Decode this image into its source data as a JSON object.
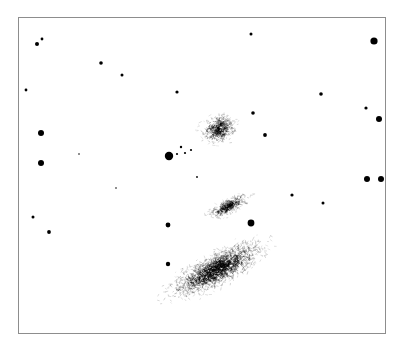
{
  "figure": {
    "kind": "astronomical-plate",
    "background_color": "#ffffff",
    "ink_color": "#000000",
    "frame": {
      "border_color": "#8d8d8d",
      "x": 18,
      "y": 17,
      "width": 368,
      "height": 317
    }
  },
  "chart_data": {
    "type": "scatter",
    "title": "",
    "xlabel": "",
    "ylabel": "",
    "xlim": [
      0,
      368
    ],
    "ylim": [
      0,
      317
    ],
    "grid": false,
    "legend": "none",
    "axes_visible": false,
    "series": [
      {
        "name": "point-sources",
        "marker": "filled-circle",
        "color": "#000000",
        "points": [
          {
            "x": 18,
            "y": 26,
            "r": 2.0
          },
          {
            "x": 23,
            "y": 21,
            "r": 1.4
          },
          {
            "x": 7,
            "y": 72,
            "r": 1.4
          },
          {
            "x": 82,
            "y": 45,
            "r": 1.8
          },
          {
            "x": 103,
            "y": 57,
            "r": 1.5
          },
          {
            "x": 158,
            "y": 74,
            "r": 1.6
          },
          {
            "x": 232,
            "y": 16,
            "r": 1.5
          },
          {
            "x": 302,
            "y": 76,
            "r": 1.8
          },
          {
            "x": 355,
            "y": 23,
            "r": 3.6
          },
          {
            "x": 347,
            "y": 90,
            "r": 1.6
          },
          {
            "x": 234,
            "y": 95,
            "r": 1.8
          },
          {
            "x": 246,
            "y": 117,
            "r": 1.9
          },
          {
            "x": 360,
            "y": 101,
            "r": 3.0
          },
          {
            "x": 22,
            "y": 115,
            "r": 3.0
          },
          {
            "x": 22,
            "y": 145,
            "r": 3.0
          },
          {
            "x": 150,
            "y": 138,
            "r": 4.2
          },
          {
            "x": 162,
            "y": 129,
            "r": 1.2
          },
          {
            "x": 158,
            "y": 136,
            "r": 1.1
          },
          {
            "x": 166,
            "y": 135,
            "r": 1.1
          },
          {
            "x": 172,
            "y": 132,
            "r": 1.1
          },
          {
            "x": 178,
            "y": 159,
            "r": 0.9
          },
          {
            "x": 362,
            "y": 161,
            "r": 3.0
          },
          {
            "x": 273,
            "y": 177,
            "r": 1.6
          },
          {
            "x": 304,
            "y": 185,
            "r": 1.5
          },
          {
            "x": 348,
            "y": 161,
            "r": 3.0
          },
          {
            "x": 14,
            "y": 199,
            "r": 1.5
          },
          {
            "x": 30,
            "y": 214,
            "r": 1.9
          },
          {
            "x": 149,
            "y": 207,
            "r": 2.4
          },
          {
            "x": 232,
            "y": 205,
            "r": 3.4
          },
          {
            "x": 149,
            "y": 246,
            "r": 2.2
          },
          {
            "x": 60,
            "y": 136,
            "r": 0.8
          },
          {
            "x": 97,
            "y": 170,
            "r": 0.8
          }
        ]
      }
    ],
    "extended_objects": [
      {
        "name": "upper-elliptical-galaxy",
        "shape": "ellipse",
        "cx": 200,
        "cy": 111,
        "rx": 19,
        "ry": 15,
        "angle_deg": -25,
        "grain_count": 430,
        "density": "medium"
      },
      {
        "name": "middle-edge-on-galaxy",
        "shape": "ellipse",
        "cx": 210,
        "cy": 188,
        "rx": 23,
        "ry": 8,
        "angle_deg": -28,
        "grain_count": 360,
        "density": "medium-high"
      },
      {
        "name": "large-edge-on-spiral-galaxy",
        "shape": "ellipse",
        "cx": 199,
        "cy": 251,
        "rx": 56,
        "ry": 17,
        "angle_deg": -27,
        "grain_count": 1700,
        "density": "high"
      }
    ]
  }
}
